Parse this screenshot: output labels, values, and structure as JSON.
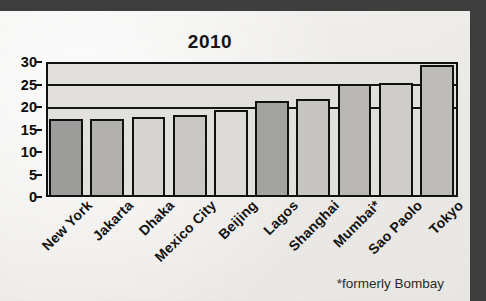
{
  "figure": {
    "title": "2010",
    "footnote": "*formerly Bombay"
  },
  "chart_data": {
    "type": "bar",
    "title": "2010",
    "xlabel": "",
    "ylabel": "",
    "ylim": [
      0,
      30
    ],
    "yticks": [
      0,
      5,
      10,
      15,
      20,
      25,
      30
    ],
    "ytick_labels": [
      "0",
      "5",
      "10",
      "15",
      "20",
      "25",
      "30"
    ],
    "gridlines": [
      20,
      25
    ],
    "grid": true,
    "legend": "none",
    "annotations": [
      "*formerly Bombay"
    ],
    "categories": [
      "New York",
      "Jakarta",
      "Dhaka",
      "Mexico City",
      "Beijing",
      "Lagos",
      "Shanghai",
      "Mumbai*",
      "Sao Paolo",
      "Tokyo"
    ],
    "values": [
      17.0,
      17.0,
      17.4,
      17.8,
      19.0,
      21.0,
      21.4,
      24.6,
      24.8,
      28.8
    ],
    "bar_colors": [
      "#9d9d9b",
      "#b2b1ae",
      "#d6d5d1",
      "#c9c8c4",
      "#dcdbd7",
      "#a3a3a0",
      "#c6c5c1",
      "#b9b8b4",
      "#cfcecA",
      "#bdbcb8"
    ]
  }
}
